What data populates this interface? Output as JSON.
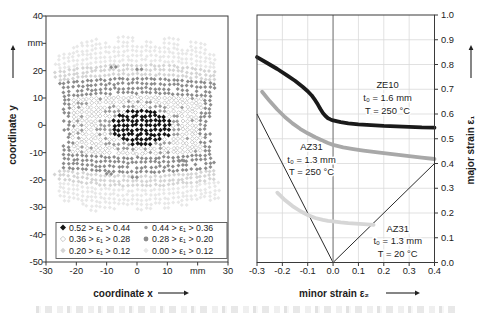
{
  "colors": {
    "frame": "#3a3a3a",
    "grid": "#d9d9d9",
    "zero_line": "#8a8a8a",
    "tick_text": "#1c1c1c",
    "band_black": "#151515",
    "band_gray": "#9c9c9c",
    "band_open_stroke": "#c3c3c3",
    "band_dark": "#8c8c8c",
    "band_light": "#d4d4d4",
    "band_lightest": "#e8e8e8",
    "curve_ze10": "#1a1a1a",
    "curve_az31_250": "#a8a8a8",
    "curve_az31_20": "#d6d6d6"
  },
  "chart_data": [
    {
      "type": "scatter",
      "panel": "specimen-strain-map",
      "xlabel": "coordinate x",
      "ylabel": "coordinate y",
      "unit": "mm",
      "xlim": [
        -30,
        30
      ],
      "ylim": [
        -50,
        40
      ],
      "xtick_values": [
        -30,
        -20,
        -10,
        0,
        10,
        20,
        30
      ],
      "xtick_labels": [
        "-30",
        "-20",
        "-10",
        "0",
        "10",
        "mm",
        "30"
      ],
      "ytick_values": [
        40,
        30,
        20,
        10,
        0,
        -10,
        -20,
        -30,
        -40,
        -50
      ],
      "ytick_labels": [
        "40",
        "mm",
        "20",
        "10",
        "0",
        "-10",
        "-20",
        "-30",
        "-40",
        "-50"
      ],
      "legend": [
        {
          "band": "black",
          "label": "0.52 > ε₁ > 0.44"
        },
        {
          "band": "gray",
          "label": "0.44 > ε₁ > 0.36"
        },
        {
          "band": "open",
          "label": "0.36 > ε₁ > 0.28"
        },
        {
          "band": "dark",
          "label": "0.28 > ε₁ > 0.20"
        },
        {
          "band": "light",
          "label": "0.20 > ε₁ > 0.12"
        },
        {
          "band": "lightest",
          "label": "0.00 > ε₁ > 0.12"
        }
      ],
      "field": {
        "grid_dx": 1.5,
        "grid_dy": 1.7,
        "halfwidth_center": 23.8,
        "halfwidth_edge": 26.8,
        "specimen_top": 34.5,
        "specimen_bottom": -33.5,
        "dark_band_y": [
          10.5,
          17
        ],
        "light_band_y": [
          17,
          22.3
        ],
        "edge_dark_margin": 2.9,
        "gray_ellipse": {
          "cx": 1.0,
          "cy": -0.5,
          "rx": 14.0,
          "ry": 9.3
        },
        "black_ellipse": {
          "cx": 1.5,
          "cy": -0.5,
          "rx": 10.0,
          "ry": 6.8
        },
        "stray_dark_dots": [
          [
            -8.5,
            21.5
          ],
          [
            -7,
            21.5
          ],
          [
            0,
            20.5
          ],
          [
            1.5,
            20.5
          ],
          [
            -10,
            -18
          ],
          [
            -8.5,
            -18
          ],
          [
            -1.5,
            -19
          ],
          [
            0,
            -19
          ],
          [
            14,
            -13.5
          ],
          [
            15.5,
            -13.5
          ]
        ]
      }
    },
    {
      "type": "line",
      "panel": "forming-limit-diagram",
      "xlabel": "minor strain ε₂",
      "ylabel": "major strain ε₁",
      "xlim": [
        -0.3,
        0.4
      ],
      "ylim": [
        0.0,
        1.0
      ],
      "xtick_labels": [
        "-0.3",
        "-0.2",
        "-0.1",
        "0.0",
        "0.1",
        "0.2",
        "0.3",
        "0.4"
      ],
      "xtick_values": [
        -0.3,
        -0.2,
        -0.1,
        0.0,
        0.1,
        0.2,
        0.3,
        0.4
      ],
      "ytick_labels": [
        "1.0",
        "0.9",
        "0.8",
        "0.7",
        "0.6",
        "0.5",
        "0.4",
        "0.3",
        "0.2",
        "0.1",
        "0.0"
      ],
      "ytick_values": [
        1.0,
        0.9,
        0.8,
        0.7,
        0.6,
        0.5,
        0.4,
        0.3,
        0.2,
        0.1,
        0.0
      ],
      "grid_step": 0.1,
      "reference_lines": [
        {
          "name": "uniaxial-path",
          "from": [
            0,
            0
          ],
          "to": [
            -0.3,
            0.6
          ]
        },
        {
          "name": "biaxial-path",
          "from": [
            0,
            0
          ],
          "to": [
            0.4,
            0.4
          ]
        },
        {
          "name": "plane-strain-axis",
          "vertical_at": 0.0
        }
      ],
      "series": [
        {
          "name": "ZE10",
          "label_lines": [
            "ZE10",
            "t₀ = 1.6 mm",
            "T = 250 °C"
          ],
          "label_anchor": [
            0.215,
            0.705
          ],
          "color_key": "curve_ze10",
          "points": [
            [
              -0.3,
              0.83
            ],
            [
              -0.26,
              0.806
            ],
            [
              -0.22,
              0.782
            ],
            [
              -0.18,
              0.755
            ],
            [
              -0.15,
              0.734
            ],
            [
              -0.12,
              0.71
            ],
            [
              -0.1,
              0.692
            ],
            [
              -0.085,
              0.676
            ],
            [
              -0.07,
              0.655
            ],
            [
              -0.06,
              0.638
            ],
            [
              -0.05,
              0.62
            ],
            [
              -0.04,
              0.604
            ],
            [
              -0.03,
              0.592
            ],
            [
              -0.02,
              0.583
            ],
            [
              -0.01,
              0.578
            ],
            [
              0.0,
              0.574
            ],
            [
              0.03,
              0.567
            ],
            [
              0.06,
              0.562
            ],
            [
              0.1,
              0.558
            ],
            [
              0.15,
              0.555
            ],
            [
              0.2,
              0.552
            ],
            [
              0.25,
              0.55
            ],
            [
              0.3,
              0.548
            ],
            [
              0.35,
              0.546
            ],
            [
              0.4,
              0.545
            ]
          ]
        },
        {
          "name": "AZ31-250C",
          "label_lines": [
            "AZ31",
            "t₀ = 1.3 mm",
            "T = 250 °C"
          ],
          "label_anchor": [
            -0.085,
            0.455
          ],
          "color_key": "curve_az31_250",
          "points": [
            [
              -0.28,
              0.69
            ],
            [
              -0.25,
              0.652
            ],
            [
              -0.22,
              0.618
            ],
            [
              -0.19,
              0.588
            ],
            [
              -0.16,
              0.562
            ],
            [
              -0.13,
              0.54
            ],
            [
              -0.1,
              0.522
            ],
            [
              -0.07,
              0.506
            ],
            [
              -0.04,
              0.492
            ],
            [
              -0.02,
              0.483
            ],
            [
              0.0,
              0.475
            ],
            [
              0.04,
              0.465
            ],
            [
              0.08,
              0.458
            ],
            [
              0.12,
              0.452
            ],
            [
              0.16,
              0.447
            ],
            [
              0.2,
              0.442
            ],
            [
              0.25,
              0.436
            ],
            [
              0.3,
              0.43
            ],
            [
              0.35,
              0.424
            ],
            [
              0.4,
              0.418
            ]
          ]
        },
        {
          "name": "AZ31-20C",
          "label_lines": [
            "AZ31",
            "t₀ = 1.3 mm",
            "T = 20 °C"
          ],
          "label_anchor": [
            0.255,
            0.125
          ],
          "color_key": "curve_az31_20",
          "points": [
            [
              -0.22,
              0.282
            ],
            [
              -0.19,
              0.252
            ],
            [
              -0.16,
              0.228
            ],
            [
              -0.13,
              0.208
            ],
            [
              -0.1,
              0.192
            ],
            [
              -0.07,
              0.18
            ],
            [
              -0.04,
              0.172
            ],
            [
              -0.02,
              0.168
            ],
            [
              0.0,
              0.166
            ],
            [
              0.03,
              0.162
            ],
            [
              0.06,
              0.159
            ],
            [
              0.09,
              0.157
            ],
            [
              0.12,
              0.155
            ],
            [
              0.16,
              0.152
            ]
          ]
        }
      ]
    }
  ]
}
